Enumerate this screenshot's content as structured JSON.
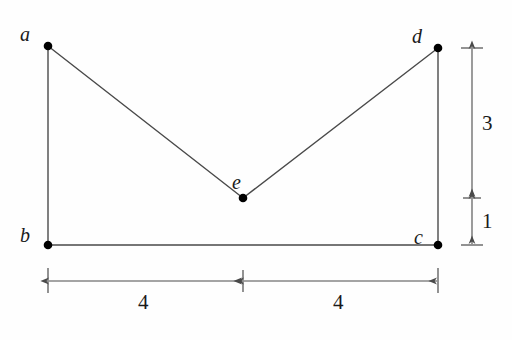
{
  "figure": {
    "background_color": "#fefefe",
    "stroke_color": "#4a4a4a",
    "dot_color": "#000000",
    "label_color": "#1a1a1a"
  },
  "vertices": [
    {
      "id": "a",
      "label": "a",
      "x": 48,
      "y": 46,
      "label_x": 20,
      "label_y": 24
    },
    {
      "id": "d",
      "label": "d",
      "x": 438,
      "y": 48,
      "label_x": 412,
      "label_y": 26
    },
    {
      "id": "e",
      "label": "e",
      "x": 243,
      "y": 198,
      "label_x": 232,
      "label_y": 172
    },
    {
      "id": "b",
      "label": "b",
      "x": 48,
      "y": 245,
      "label_x": 20,
      "label_y": 225
    },
    {
      "id": "c",
      "label": "c",
      "x": 438,
      "y": 245,
      "label_x": 414,
      "label_y": 227
    }
  ],
  "edges": [
    {
      "id": "a-b",
      "from": "a",
      "to": "b"
    },
    {
      "id": "b-c",
      "from": "b",
      "to": "c"
    },
    {
      "id": "c-d",
      "from": "c",
      "to": "d"
    },
    {
      "id": "a-e",
      "from": "a",
      "to": "e"
    },
    {
      "id": "e-d",
      "from": "e",
      "to": "d"
    }
  ],
  "dimensions": {
    "horizontal": [
      {
        "id": "left-span",
        "value": "4",
        "from_x": 48,
        "to_x": 243,
        "y": 281,
        "label_x": 145,
        "label_y": 292
      },
      {
        "id": "right-span",
        "value": "4",
        "from_x": 243,
        "to_x": 438,
        "y": 281,
        "label_x": 340,
        "label_y": 292
      }
    ],
    "vertical": [
      {
        "id": "upper-height",
        "value": "3",
        "x": 472,
        "from_y": 48,
        "to_y": 198,
        "label_x": 482,
        "label_y": 113
      },
      {
        "id": "lower-height",
        "value": "1",
        "x": 472,
        "from_y": 198,
        "to_y": 245,
        "label_x": 482,
        "label_y": 211
      }
    ]
  }
}
